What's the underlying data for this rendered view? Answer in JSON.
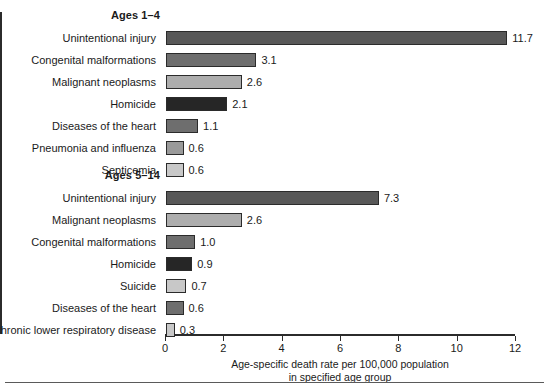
{
  "chart_data": {
    "type": "bar",
    "orientation": "horizontal",
    "title": "",
    "xlabel_line1": "Age-specific death rate per 100,000 population",
    "xlabel_line2": "in specified age group",
    "ylabel": "",
    "xlim": [
      0,
      12
    ],
    "xticks": [
      0,
      2,
      4,
      6,
      8,
      10,
      12
    ],
    "xtick_labels": [
      "0",
      "2",
      "4",
      "6",
      "8",
      "10",
      "12"
    ],
    "grid": false,
    "legend": "none",
    "groups": [
      {
        "name": "Ages 1–4",
        "categories": [
          "Unintentional injury",
          "Congenital malformations",
          "Malignant neoplasms",
          "Homicide",
          "Diseases of the heart",
          "Pneumonia and influenza",
          "Septicemia"
        ],
        "values": [
          11.7,
          3.1,
          2.6,
          2.1,
          1.1,
          0.6,
          0.6
        ],
        "value_labels": [
          "11.7",
          "3.1",
          "2.6",
          "2.1",
          "1.1",
          "0.6",
          "0.6"
        ],
        "colors": [
          "#585858",
          "#6e6e6e",
          "#adadad",
          "#262626",
          "#6e6e6e",
          "#9a9a9a",
          "#c8c8c8"
        ]
      },
      {
        "name": "Ages 5–14",
        "categories": [
          "Unintentional injury",
          "Malignant neoplasms",
          "Congenital malformations",
          "Homicide",
          "Suicide",
          "Diseases of the heart",
          "Chronic lower respiratory disease"
        ],
        "values": [
          7.3,
          2.6,
          1.0,
          0.9,
          0.7,
          0.6,
          0.3
        ],
        "value_labels": [
          "7.3",
          "2.6",
          "1.0",
          "0.9",
          "0.7",
          "0.6",
          "0.3"
        ],
        "colors": [
          "#585858",
          "#adadad",
          "#6e6e6e",
          "#262626",
          "#c8c8c8",
          "#6e6e6e",
          "#c8c8c8"
        ]
      }
    ]
  }
}
